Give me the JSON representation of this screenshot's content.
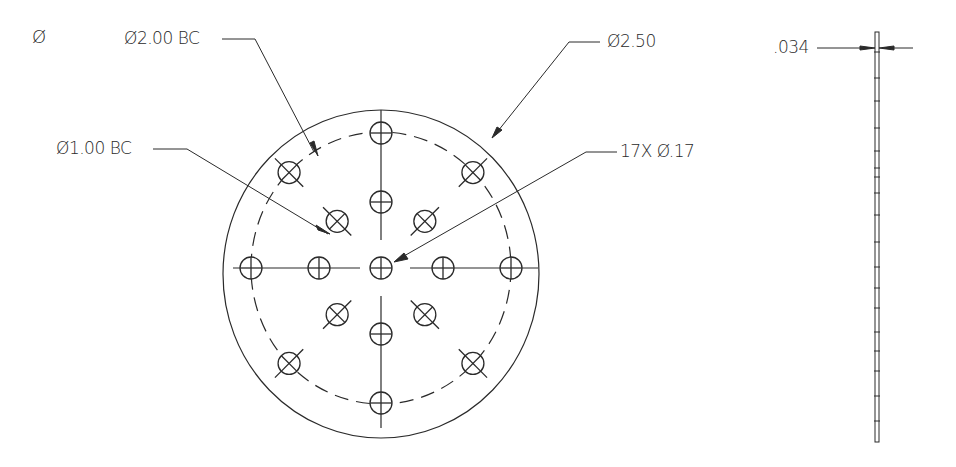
{
  "drawing": {
    "title": "Circular perforated plate — front and side views",
    "units": "inches",
    "line_color": "#2a2a2a",
    "background": "#ffffff"
  },
  "annotations": {
    "diameter_symbol": "Ø",
    "outer_bc": "Ø2.00 BC",
    "inner_bc": "Ø1.00 BC",
    "outer_diameter": "Ø2.50",
    "hole_callout": "17X  Ø.17",
    "thickness": ".034"
  },
  "geometry": {
    "plate_diameter": 2.5,
    "outer_bolt_circle": 2.0,
    "inner_bolt_circle": 1.0,
    "hole_count": 17,
    "hole_diameter": 0.17,
    "thickness": 0.034,
    "outer_bc_holes": 8,
    "inner_bc_holes": 8,
    "center_holes": 1
  }
}
